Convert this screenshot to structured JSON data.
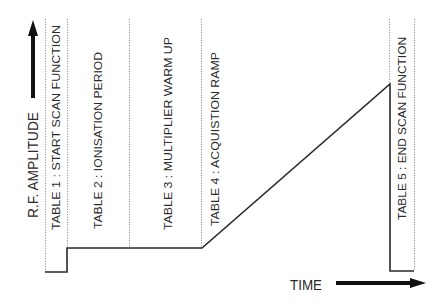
{
  "diagram": {
    "y_axis_label": "R.F. AMPLITUDE",
    "x_axis_label": "TIME",
    "tables": [
      {
        "label": "TABLE 1 :  START SCAN FUNCTION"
      },
      {
        "label": "TABLE 2 :  IONISATION PERIOD"
      },
      {
        "label": "TABLE 3 :  MULTIPLIER WARM UP"
      },
      {
        "label": "TABLE 4 :  ACQUISTION RAMP"
      },
      {
        "label": "TABLE 5 :  END SCAN FUNCTION"
      }
    ],
    "colors": {
      "line": "#2a2a2a",
      "divider": "#777777",
      "background": "#ffffff"
    }
  }
}
